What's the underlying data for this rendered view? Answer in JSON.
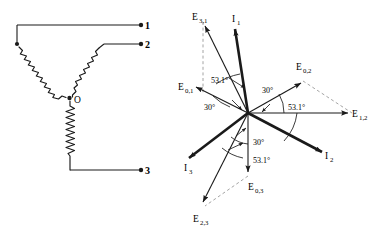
{
  "figure": {
    "line_color": "#1a1a1a",
    "dashed_color": "#8a8a8a",
    "background": "#ffffff"
  },
  "circuit": {
    "name": "wye-connection-schematic",
    "center_node_label": "O",
    "element_type": "coil",
    "coil_count": 3,
    "terminals": [
      {
        "id": "terminal-1",
        "label": "1"
      },
      {
        "id": "terminal-2",
        "label": "2"
      },
      {
        "id": "terminal-3",
        "label": "3"
      }
    ]
  },
  "phasor": {
    "name": "phasor-diagram",
    "origin_label": "",
    "vectors": [
      {
        "id": "I1",
        "label": "I",
        "subscript": "1",
        "kind": "current",
        "weight": "heavy",
        "angle_deg": 78,
        "length": 95
      },
      {
        "id": "I2",
        "label": "I",
        "subscript": "2",
        "kind": "current",
        "weight": "heavy",
        "angle_deg": -42,
        "length": 95
      },
      {
        "id": "I3",
        "label": "I",
        "subscript": "3",
        "kind": "current",
        "weight": "heavy",
        "angle_deg": 198,
        "length": 95
      },
      {
        "id": "E12",
        "label": "E",
        "subscript": "1,2",
        "kind": "voltage-line",
        "weight": "light",
        "angle_deg": 0,
        "length": 110
      },
      {
        "id": "E31",
        "label": "E",
        "subscript": "3,1",
        "kind": "voltage-line",
        "weight": "light",
        "angle_deg": 120,
        "length": 110
      },
      {
        "id": "E23",
        "label": "E",
        "subscript": "2,3",
        "kind": "voltage-line",
        "weight": "light",
        "angle_deg": 240,
        "length": 110
      },
      {
        "id": "E02",
        "label": "E",
        "subscript": "0,2",
        "kind": "voltage-phase",
        "weight": "light",
        "angle_deg": 30,
        "length": 64
      },
      {
        "id": "E01",
        "label": "E",
        "subscript": "0,1",
        "kind": "voltage-phase",
        "weight": "light",
        "angle_deg": 150,
        "length": 64
      },
      {
        "id": "E03",
        "label": "E",
        "subscript": "0,3",
        "kind": "voltage-phase",
        "weight": "light",
        "angle_deg": 270,
        "length": 64
      }
    ],
    "angle_labels": [
      {
        "id": "ang-30-upper-right",
        "text": "30°"
      },
      {
        "id": "ang-531-right",
        "text": "53.1°"
      },
      {
        "id": "ang-30-upper-left",
        "text": "30°"
      },
      {
        "id": "ang-531-upper-left",
        "text": "53.1°"
      },
      {
        "id": "ang-30-lower",
        "text": "30°"
      },
      {
        "id": "ang-531-lower",
        "text": "53.1°"
      }
    ],
    "construction_lines": [
      {
        "id": "dash-E31-vertical",
        "style": "dashed"
      },
      {
        "id": "dash-E02-to-E12",
        "style": "dashed"
      },
      {
        "id": "dash-E03-to-E23",
        "style": "dashed"
      }
    ]
  }
}
